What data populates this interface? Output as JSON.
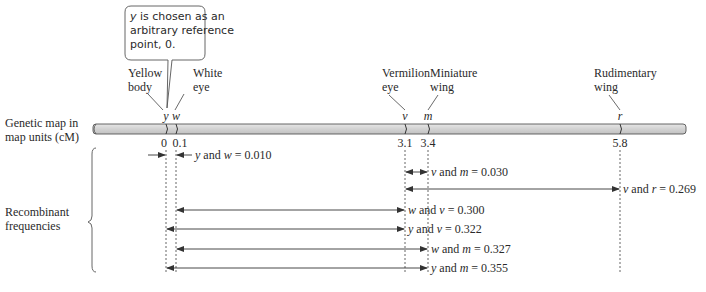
{
  "callout": {
    "lines": [
      "is chosen as an",
      "arbitrary reference",
      "point, 0."
    ],
    "symbol": "y"
  },
  "map_label": [
    "Genetic map in",
    "map units (cM)"
  ],
  "recombinant_label": [
    "Recombinant",
    "frequencies"
  ],
  "genes": [
    {
      "symbol": "y",
      "name": [
        "Yellow",
        "body"
      ],
      "position": 0,
      "tick_label": "0"
    },
    {
      "symbol": "w",
      "name": [
        "White",
        "eye"
      ],
      "position": 0.1,
      "tick_label": "0.1"
    },
    {
      "symbol": "v",
      "name": [
        "Vermilion",
        "eye"
      ],
      "position": 3.1,
      "tick_label": "3.1"
    },
    {
      "symbol": "m",
      "name": [
        "Miniature",
        "wing"
      ],
      "position": 3.4,
      "tick_label": "3.4"
    },
    {
      "symbol": "r",
      "name": [
        "Rudimentary",
        "wing"
      ],
      "position": 5.8,
      "tick_label": "5.8"
    }
  ],
  "frequencies": [
    {
      "a": "y",
      "b": "w",
      "value": "0.010",
      "style": "inward"
    },
    {
      "a": "v",
      "b": "m",
      "value": "0.030",
      "style": "short"
    },
    {
      "a": "v",
      "b": "r",
      "value": "0.269",
      "style": "span"
    },
    {
      "a": "w",
      "b": "v",
      "value": "0.300",
      "style": "span"
    },
    {
      "a": "y",
      "b": "v",
      "value": "0.322",
      "style": "span"
    },
    {
      "a": "w",
      "b": "m",
      "value": "0.327",
      "style": "span"
    },
    {
      "a": "y",
      "b": "m",
      "value": "0.355",
      "style": "span"
    }
  ],
  "colors": {
    "bar_fill": "#d4d4d4",
    "bar_stroke": "#555555",
    "line": "#333333"
  }
}
